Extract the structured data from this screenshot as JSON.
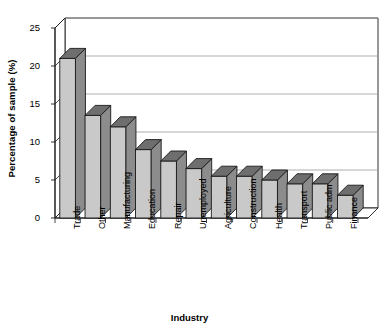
{
  "chart_data": {
    "type": "bar",
    "title": "",
    "subtitle": "",
    "xlabel": "Industry",
    "ylabel": "Percentage of sample (%)",
    "categories": [
      "Trade",
      "Other",
      "Manufacturing",
      "Education",
      "Repair",
      "Unemployed",
      "Agriculture",
      "Construction",
      "Health",
      "Transport",
      "Public adm",
      "Finance"
    ],
    "values": [
      21,
      13.5,
      12,
      9,
      7.5,
      6.5,
      5.5,
      5.5,
      5,
      4.5,
      4.5,
      3
    ],
    "ylim": [
      0,
      25
    ],
    "yticks": [
      0,
      5,
      10,
      15,
      20,
      25
    ],
    "ytick_labels": [
      "0",
      "5",
      "10",
      "15",
      "20",
      "25"
    ],
    "grid": true,
    "grid_axis": "y",
    "legend": false,
    "legend_position": "none",
    "style": "3d-column",
    "bar_face_color": "#c9c9c9",
    "bar_side_color": "#8c8c8c",
    "bar_top_color": "#6e6e6e",
    "bar_edge_color": "#1a1a1a",
    "grid_color": "#9a9a9a",
    "axis_color": "#1a1a1a",
    "background_color": "#ffffff"
  },
  "axes": {
    "y_title": "Percentage of sample (%)",
    "x_title": "Industry"
  }
}
